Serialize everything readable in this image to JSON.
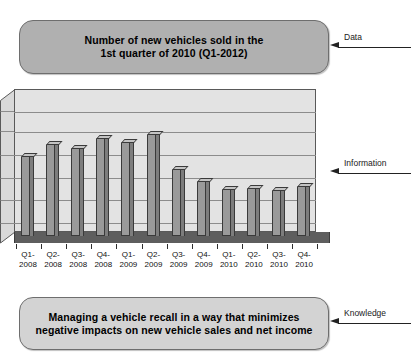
{
  "data_box": {
    "line1": "Number of new vehicles sold in the",
    "line2": "1st quarter of 2010 (Q1-2012)",
    "fill_color": "#b0b0b0"
  },
  "knowledge_box": {
    "line1": "Managing a vehicle recall in a way that minimizes",
    "line2": "negative impacts on new vehicle sales and net income",
    "fill_color": "#d3d3d3"
  },
  "annotations": {
    "data": "Data",
    "information": "Information",
    "knowledge": "Knowledge"
  },
  "chart_data": {
    "type": "bar",
    "title": "",
    "xlabel": "",
    "ylabel": "",
    "grid": true,
    "legend": "none",
    "style": "3d-column",
    "ylim": [
      0,
      6
    ],
    "gridlines": [
      0,
      1,
      2,
      3,
      4,
      5,
      6
    ],
    "categories": [
      "Q1-2008",
      "Q2-2008",
      "Q3-2008",
      "Q4-2008",
      "Q1-2009",
      "Q2-2009",
      "Q3-2009",
      "Q4-2009",
      "Q1-2010",
      "Q2-2010",
      "Q3-2010",
      "Q4-2010"
    ],
    "category_lines": [
      [
        "Q1-",
        "2008"
      ],
      [
        "Q2-",
        "2008"
      ],
      [
        "Q3-",
        "2008"
      ],
      [
        "Q4-",
        "2008"
      ],
      [
        "Q1-",
        "2009"
      ],
      [
        "Q2-",
        "2009"
      ],
      [
        "Q3-",
        "2009"
      ],
      [
        "Q4-",
        "2009"
      ],
      [
        "Q1-",
        "2010"
      ],
      [
        "Q2-",
        "2010"
      ],
      [
        "Q3-",
        "2010"
      ],
      [
        "Q4-",
        "2010"
      ]
    ],
    "values": [
      4.0,
      4.6,
      4.4,
      4.9,
      4.7,
      5.1,
      3.4,
      2.8,
      2.4,
      2.45,
      2.35,
      2.55
    ],
    "bar_colors": {
      "front": "#9a9a9a",
      "side": "#7d7d7d",
      "top": "#c4c4c4",
      "outline": "#3a3a3a"
    },
    "plot_colors": {
      "wall": "#e3e3e3",
      "floor": "#5e5e5e",
      "gridline": "#8c8c8c",
      "border": "#595959"
    }
  }
}
